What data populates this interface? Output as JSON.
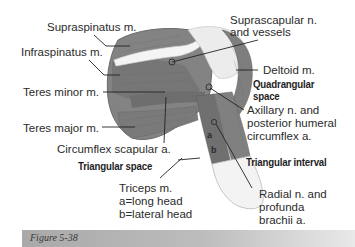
{
  "figure": {
    "caption": "Figure 5-38",
    "labels": {
      "supraspinatus": "Supraspinatus m.",
      "infraspinatus": "Infraspinatus m.",
      "teres_minor": "Teres minor m.",
      "teres_major": "Teres major m.",
      "circumflex_scapular": "Circumflex scapular a.",
      "triangular_space": "Triangular space",
      "triceps_line1": "Triceps m.",
      "triceps_line2": "a=long head",
      "triceps_line3": "b=lateral head",
      "suprascapular_line1": "Suprascapular n.",
      "suprascapular_line2": "and vessels",
      "deltoid": "Deltoid m.",
      "quadrangular_line1": "Quadrangular",
      "quadrangular_line2": "space",
      "axillary_line1": "Axillary n. and",
      "axillary_line2": "posterior humeral",
      "axillary_line3": "circumflex a.",
      "triangular_interval": "Triangular interval",
      "radial_line1": "Radial n. and",
      "radial_line2": "profunda",
      "radial_line3": "brachii a.",
      "letter_a": "a",
      "letter_b": "b"
    },
    "colors": {
      "muscle": "#7d7d7d",
      "muscle_dark": "#5e5e5e",
      "bone": "#f2f2f2",
      "leader_line": "#222222",
      "caption_bar": "#b0b0b0"
    }
  }
}
